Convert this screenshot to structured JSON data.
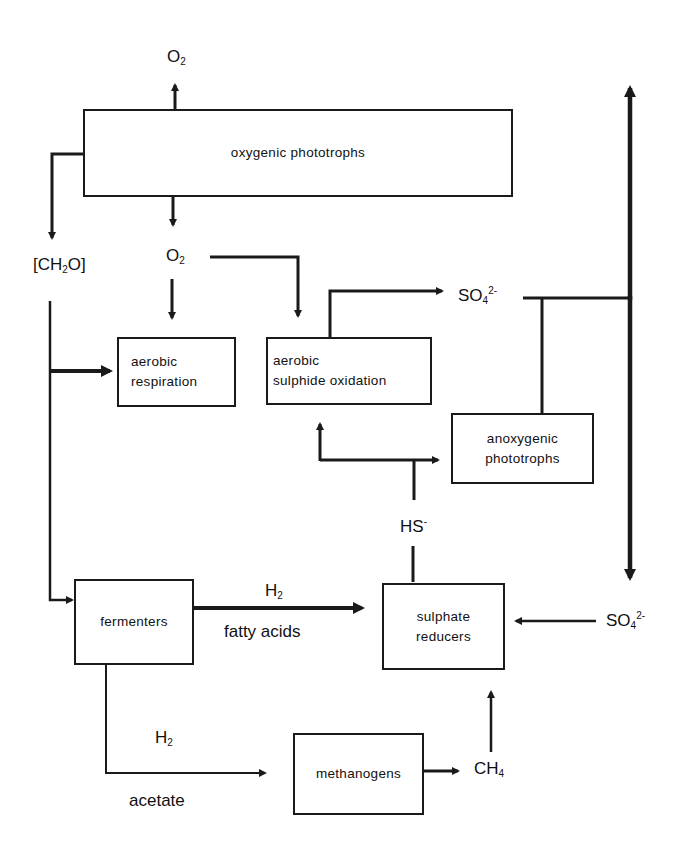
{
  "diagram": {
    "type": "microbial sulphur/carbon cycle flow diagram",
    "nodes": {
      "oxygenic": {
        "label": "oxygenic phototrophs"
      },
      "aerobic_resp": {
        "line1": "aerobic",
        "line2": "respiration"
      },
      "aerobic_sulf": {
        "line1": "aerobic",
        "line2": "sulphide oxidation"
      },
      "anoxygenic": {
        "line1": "anoxygenic",
        "line2": "phototrophs"
      },
      "fermenters": {
        "label": "fermenters"
      },
      "sulphate_red": {
        "line1": "sulphate",
        "line2": "reducers"
      },
      "methanogens": {
        "label": "methanogens"
      }
    },
    "labels": {
      "o2_top": {
        "base": "O",
        "sub": "2"
      },
      "o2_mid": {
        "base": "O",
        "sub": "2"
      },
      "ch2o": {
        "pre": "[CH",
        "sub": "2",
        "post": "O]"
      },
      "so4_top": {
        "base": "SO",
        "sub": "4",
        "sup": "2-"
      },
      "so4_right": {
        "base": "SO",
        "sub": "4",
        "sup": "2-"
      },
      "hs": {
        "base": "HS",
        "sup": "-"
      },
      "h2_upper": {
        "base": "H",
        "sub": "2"
      },
      "fatty_acids": "fatty acids",
      "h2_lower": {
        "base": "H",
        "sub": "2"
      },
      "acetate": "acetate",
      "ch4": {
        "base": "CH",
        "sub": "4"
      }
    },
    "colors": {
      "line": "#1a1a1a",
      "background": "#ffffff"
    }
  }
}
